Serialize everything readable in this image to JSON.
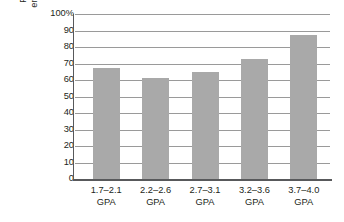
{
  "chart_data": {
    "type": "bar",
    "title": "",
    "xlabel": "",
    "ylabel": "Percentage of students endorsing practice testing",
    "ylabel_lines": [
      "Percentage of students",
      "endorsing practice testing"
    ],
    "categories": [
      "1.7–2.1 GPA",
      "2.2–2.6 GPA",
      "2.7–3.1 GPA",
      "3.2–3.6 GPA",
      "3.7–4.0 GPA"
    ],
    "category_lines": [
      [
        "1.7–2.1",
        "GPA"
      ],
      [
        "2.2–2.6",
        "GPA"
      ],
      [
        "2.7–3.1",
        "GPA"
      ],
      [
        "3.2–3.6",
        "GPA"
      ],
      [
        "3.7–4.0",
        "GPA"
      ]
    ],
    "values": [
      67,
      61,
      65,
      73,
      87
    ],
    "ylim": [
      0,
      100
    ],
    "ytick_values": [
      0,
      10,
      20,
      30,
      40,
      50,
      60,
      70,
      80,
      90,
      100
    ],
    "ytick_labels": [
      "0",
      "10",
      "20",
      "30",
      "40",
      "50",
      "60",
      "70",
      "80",
      "90",
      "100%"
    ],
    "grid": true,
    "legend": "none",
    "bar_color": "#a9a9a9",
    "axis_color": "#58595b",
    "grid_color": "#9a9a9a",
    "background": "#ffffff"
  }
}
